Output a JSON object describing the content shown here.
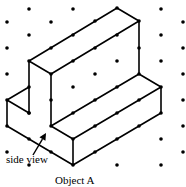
{
  "diagram": {
    "type": "isometric-dot-grid-drawing",
    "side_view_label": "side view",
    "caption": "Object A",
    "colors": {
      "ink": "#000000",
      "background": "#ffffff"
    },
    "grid_dots": [
      [
        29,
        9
      ],
      [
        73,
        9
      ],
      [
        161,
        9
      ],
      [
        7,
        22
      ],
      [
        51,
        22
      ],
      [
        183,
        22
      ],
      [
        29,
        35
      ],
      [
        161,
        35
      ],
      [
        7,
        48
      ],
      [
        183,
        48
      ],
      [
        161,
        61
      ],
      [
        117,
        61
      ],
      [
        7,
        74
      ],
      [
        95,
        74
      ],
      [
        183,
        74
      ],
      [
        73,
        87
      ],
      [
        183,
        100
      ],
      [
        29,
        113
      ],
      [
        161,
        139
      ],
      [
        183,
        126
      ],
      [
        7,
        152
      ],
      [
        183,
        152
      ],
      [
        29,
        165
      ],
      [
        117,
        165
      ],
      [
        161,
        165
      ]
    ],
    "edge_dots": [
      [
        117,
        8
      ],
      [
        95,
        21
      ],
      [
        73,
        35
      ],
      [
        51,
        48
      ],
      [
        29,
        61
      ],
      [
        139,
        21
      ],
      [
        117,
        35
      ],
      [
        95,
        48
      ],
      [
        73,
        61
      ],
      [
        51,
        74
      ],
      [
        139,
        48
      ],
      [
        139,
        74
      ],
      [
        161,
        87
      ],
      [
        29,
        87
      ],
      [
        7,
        100
      ],
      [
        29,
        113
      ],
      [
        7,
        126
      ],
      [
        51,
        100
      ],
      [
        51,
        126
      ],
      [
        29,
        139
      ],
      [
        51,
        152
      ],
      [
        73,
        139
      ],
      [
        73,
        165
      ],
      [
        73,
        113
      ],
      [
        95,
        100
      ],
      [
        117,
        87
      ],
      [
        95,
        126
      ],
      [
        117,
        113
      ],
      [
        139,
        100
      ],
      [
        95,
        152
      ],
      [
        117,
        139
      ],
      [
        139,
        126
      ],
      [
        161,
        113
      ]
    ],
    "edges": [
      [
        [
          117,
          8
        ],
        [
          29,
          61
        ]
      ],
      [
        [
          117,
          8
        ],
        [
          139,
          21
        ]
      ],
      [
        [
          139,
          21
        ],
        [
          51,
          74
        ]
      ],
      [
        [
          29,
          61
        ],
        [
          51,
          74
        ]
      ],
      [
        [
          139,
          21
        ],
        [
          139,
          74
        ]
      ],
      [
        [
          139,
          74
        ],
        [
          161,
          87
        ]
      ],
      [
        [
          29,
          61
        ],
        [
          29,
          113
        ]
      ],
      [
        [
          29,
          87
        ],
        [
          7,
          100
        ]
      ],
      [
        [
          7,
          100
        ],
        [
          29,
          113
        ]
      ],
      [
        [
          7,
          100
        ],
        [
          7,
          126
        ]
      ],
      [
        [
          7,
          126
        ],
        [
          73,
          165
        ]
      ],
      [
        [
          51,
          74
        ],
        [
          51,
          126
        ]
      ],
      [
        [
          51,
          126
        ],
        [
          139,
          74
        ]
      ],
      [
        [
          51,
          126
        ],
        [
          73,
          139
        ]
      ],
      [
        [
          73,
          139
        ],
        [
          161,
          87
        ]
      ],
      [
        [
          73,
          139
        ],
        [
          73,
          165
        ]
      ],
      [
        [
          73,
          165
        ],
        [
          161,
          113
        ]
      ],
      [
        [
          161,
          87
        ],
        [
          161,
          113
        ]
      ]
    ],
    "arrow": {
      "from": [
        33,
        155
      ],
      "to": [
        46,
        133
      ]
    }
  }
}
